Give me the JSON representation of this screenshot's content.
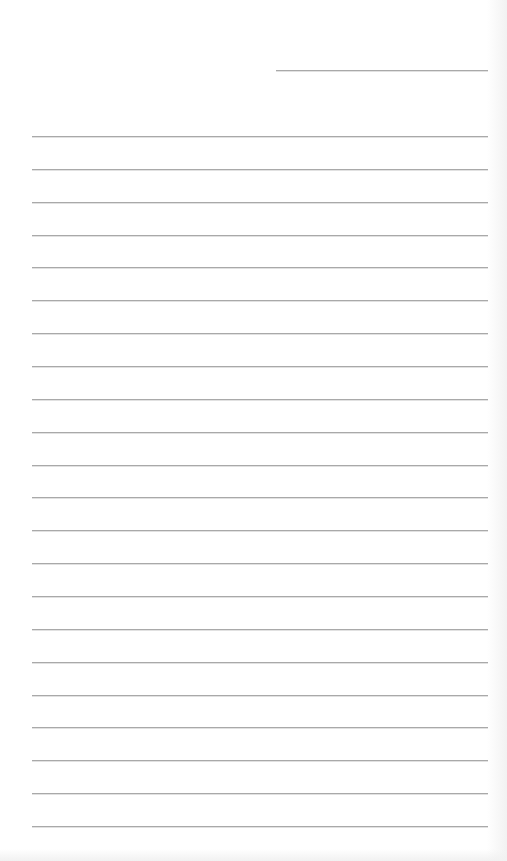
{
  "page": {
    "type": "lined-paper",
    "background_color": "#ffffff",
    "line_color": "#a9a9a9",
    "header_line": {
      "left": 276,
      "right": 488,
      "top": 70
    },
    "ruled_lines": {
      "count": 22,
      "left": 32,
      "right": 488,
      "first_top": 136,
      "spacing": 32.86
    }
  }
}
